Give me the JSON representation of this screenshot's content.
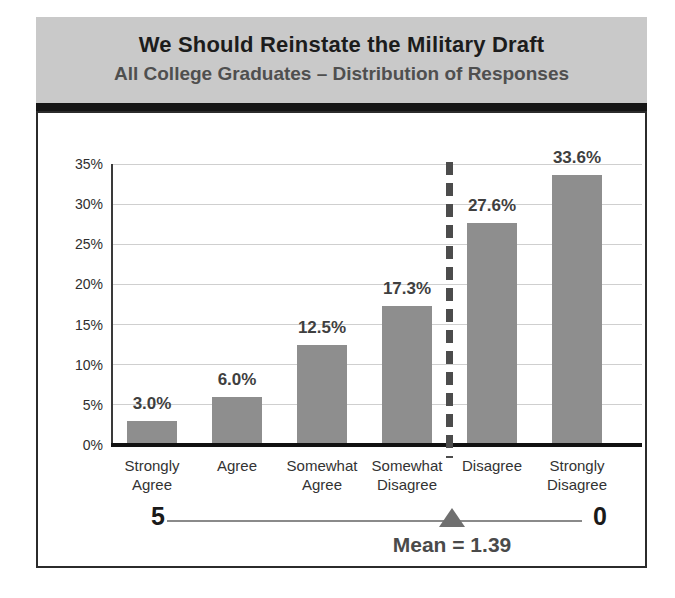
{
  "chart_data": {
    "type": "bar",
    "title": "We Should Reinstate the Military Draft",
    "subtitle": "All College Graduates – Distribution of Responses",
    "categories": [
      "Strongly Agree",
      "Agree",
      "Somewhat Agree",
      "Somewhat Disagree",
      "Disagree",
      "Strongly Disagree"
    ],
    "values": [
      3.0,
      6.0,
      12.5,
      17.3,
      27.6,
      33.6
    ],
    "value_labels": [
      "3.0%",
      "6.0%",
      "12.5%",
      "17.3%",
      "27.6%",
      "33.6%"
    ],
    "xlabel": "",
    "ylabel": "",
    "ylim": [
      0,
      35
    ],
    "yticks": [
      0,
      5,
      10,
      15,
      20,
      25,
      30,
      35
    ],
    "ytick_labels": [
      "0%",
      "5%",
      "10%",
      "15%",
      "20%",
      "25%",
      "30%",
      "35%"
    ],
    "grid": true,
    "legend": "none",
    "divider": {
      "style": "dashed-vertical",
      "between_categories": [
        "Somewhat Disagree",
        "Disagree"
      ]
    },
    "mean": 1.39,
    "mean_label": "Mean = 1.39",
    "scale_axis": {
      "left_label": "5",
      "right_label": "0",
      "marker": "triangle-up"
    },
    "bar_color": "#8e8e8e"
  },
  "colors": {
    "header_background": "#c9c9c9",
    "title_text": "#1c1c1c",
    "subtitle_text": "#4f4f4f",
    "bar_fill": "#8e8e8e",
    "divider_dash": "#4c4c4c",
    "triangle_marker": "#6f6f6f",
    "axis_line": "#111111",
    "gridline": "#cfcfcf"
  }
}
